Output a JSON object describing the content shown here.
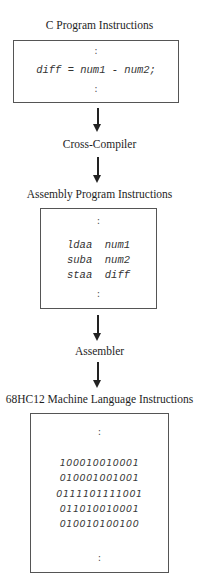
{
  "stages": {
    "c_program": {
      "title": "C Program Instructions",
      "ellipsis_top": ":",
      "code": "diff = num1 - num2;",
      "ellipsis_bottom": ":"
    },
    "cross_compiler": {
      "label": "Cross-Compiler"
    },
    "assembly": {
      "title": "Assembly Program Instructions",
      "ellipsis_top": ":",
      "lines": [
        "ldaa  num1",
        "suba  num2",
        "staa  diff"
      ],
      "ellipsis_bottom": ":"
    },
    "assembler": {
      "label": "Assembler"
    },
    "machine": {
      "title": "68HC12 Machine Language Instructions",
      "ellipsis_top": ":",
      "lines": [
        "100010010001",
        "010001001001",
        "0111101111001",
        "011010010001",
        "010010100100"
      ],
      "ellipsis_bottom": ":"
    }
  }
}
